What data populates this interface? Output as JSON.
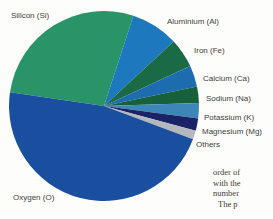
{
  "chart_data": {
    "type": "pie",
    "title": "",
    "slices": [
      {
        "label": "Silicon (Si)",
        "value": 27.7,
        "color": "#2a9469"
      },
      {
        "label": "Aluminium (Al)",
        "value": 8.1,
        "color": "#1e78be"
      },
      {
        "label": "Iron (Fe)",
        "value": 5.0,
        "color": "#1a6b45"
      },
      {
        "label": "Calcium (Ca)",
        "value": 3.6,
        "color": "#1d6cb0"
      },
      {
        "label": "Sodium (Na)",
        "value": 2.8,
        "color": "#17603c"
      },
      {
        "label": "Potassium (K)",
        "value": 2.6,
        "color": "#3c86b8"
      },
      {
        "label": "Magnesium (Mg)",
        "value": 2.1,
        "color": "#1a2366"
      },
      {
        "label": "Others",
        "value": 1.5,
        "color": "#b4b8bd"
      },
      {
        "label": "Oxygen (O)",
        "value": 46.6,
        "color": "#1a4fa0"
      }
    ],
    "start_angle_deg": 171.7,
    "direction": "clockwise",
    "center_px": {
      "x": 104,
      "y": 106
    },
    "radius_px": 95,
    "legend_position": "labels-around-pie"
  },
  "page_text": {
    "fragment_lines": [
      "order of",
      "with the",
      "number",
      "The p"
    ]
  }
}
